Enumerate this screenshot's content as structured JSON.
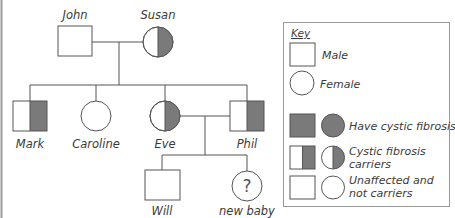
{
  "colors": {
    "affected": "#7a7a7a",
    "outline": "#555555",
    "unaffected": "#ffffff",
    "frame": "#9a9a9a"
  },
  "people": {
    "john": {
      "name": "John",
      "sex": "male",
      "status": "unaffected"
    },
    "susan": {
      "name": "Susan",
      "sex": "female",
      "status": "carrier"
    },
    "mark": {
      "name": "Mark",
      "sex": "male",
      "status": "carrier"
    },
    "caroline": {
      "name": "Caroline",
      "sex": "female",
      "status": "unaffected"
    },
    "eve": {
      "name": "Eve",
      "sex": "female",
      "status": "carrier"
    },
    "phil": {
      "name": "Phil",
      "sex": "male",
      "status": "carrier"
    },
    "will": {
      "name": "Will",
      "sex": "male",
      "status": "unaffected"
    },
    "new_baby": {
      "name": "new baby",
      "sex": "unknown",
      "status": "unknown",
      "symbol": "?"
    }
  },
  "relationships": [
    {
      "type": "couple",
      "members": [
        "John",
        "Susan"
      ],
      "children": [
        "Mark",
        "Caroline",
        "Eve",
        "Phil"
      ]
    },
    {
      "type": "couple",
      "members": [
        "Eve",
        "Phil"
      ],
      "children": [
        "Will",
        "new baby"
      ]
    }
  ],
  "key": {
    "title": "Key",
    "items": [
      {
        "symbol": "square",
        "label": "Male"
      },
      {
        "symbol": "circle",
        "label": "Female"
      },
      {
        "symbol": "filled-square-and-circle",
        "label": "Have cystic fibrosis"
      },
      {
        "symbol": "half-filled-square-and-circle",
        "label_line1": "Cystic fibrosis",
        "label_line2": "carriers"
      },
      {
        "symbol": "empty-square-and-circle",
        "label_line1": "Unaffected and",
        "label_line2": "not carriers"
      }
    ]
  }
}
